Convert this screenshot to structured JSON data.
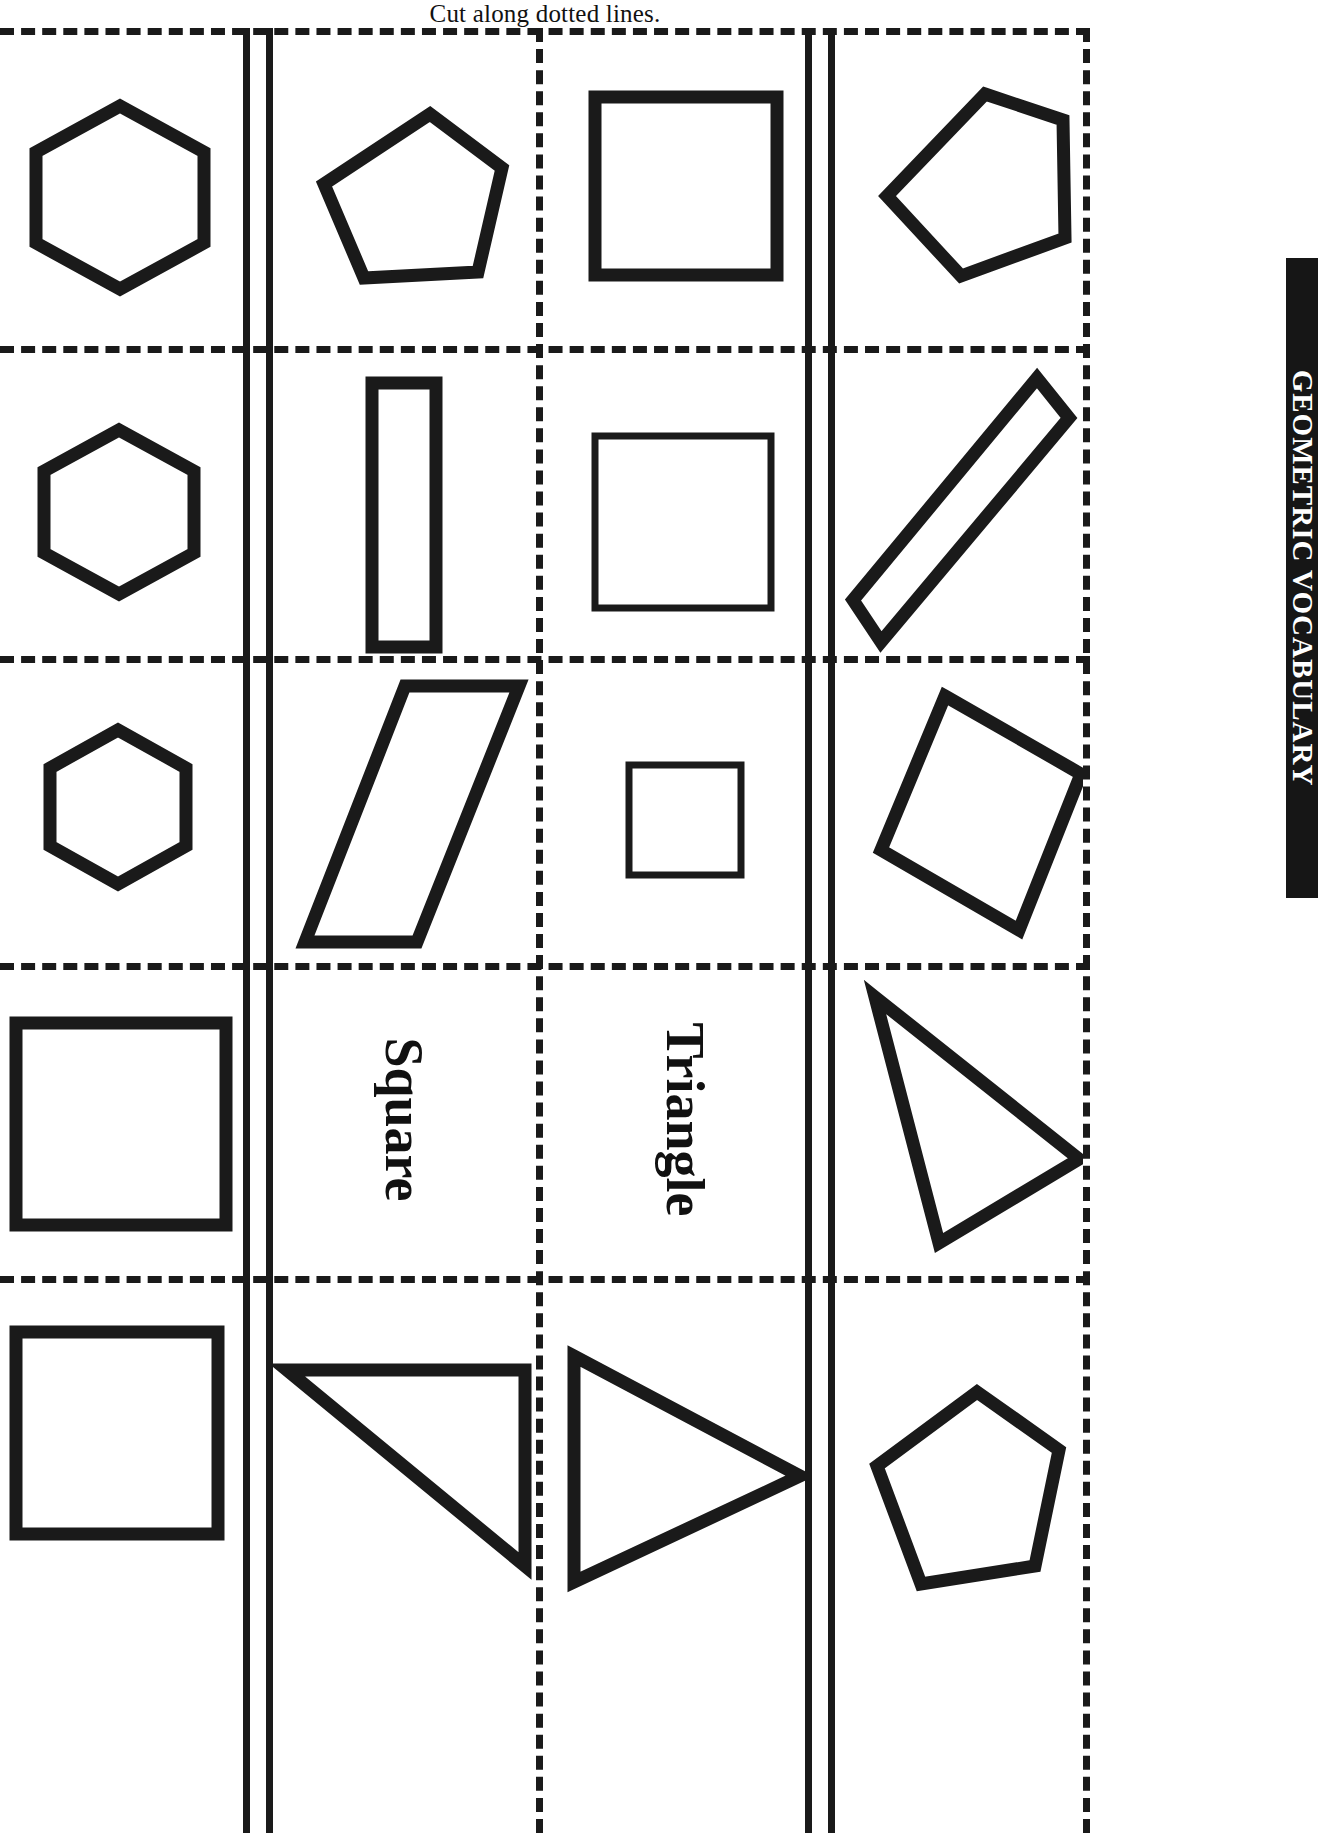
{
  "page": {
    "header_text": "Cut along dotted lines.",
    "side_tab_text": "GEOMETRIC VOCABULARY",
    "ink_color": "#1a1a1a",
    "background_color": "#ffffff",
    "tab_background_color": "#161616",
    "tab_text_color": "#ffffff",
    "columns": 4,
    "rows": 5
  },
  "cards": [
    {
      "id": "r1c1",
      "row": 1,
      "col": 1,
      "kind": "shape",
      "shape": "hexagon",
      "label": ""
    },
    {
      "id": "r1c2",
      "row": 1,
      "col": 2,
      "kind": "shape",
      "shape": "pentagon",
      "label": ""
    },
    {
      "id": "r1c3",
      "row": 1,
      "col": 3,
      "kind": "shape",
      "shape": "square",
      "label": ""
    },
    {
      "id": "r1c4",
      "row": 1,
      "col": 4,
      "kind": "shape",
      "shape": "pentagon",
      "label": ""
    },
    {
      "id": "r2c1",
      "row": 2,
      "col": 1,
      "kind": "shape",
      "shape": "hexagon",
      "label": ""
    },
    {
      "id": "r2c2",
      "row": 2,
      "col": 2,
      "kind": "shape",
      "shape": "rectangle",
      "label": ""
    },
    {
      "id": "r2c3",
      "row": 2,
      "col": 3,
      "kind": "shape",
      "shape": "square",
      "label": ""
    },
    {
      "id": "r2c4",
      "row": 2,
      "col": 4,
      "kind": "shape",
      "shape": "rectangle-rotated",
      "label": ""
    },
    {
      "id": "r3c1",
      "row": 3,
      "col": 1,
      "kind": "shape",
      "shape": "hexagon",
      "label": ""
    },
    {
      "id": "r3c2",
      "row": 3,
      "col": 2,
      "kind": "shape",
      "shape": "parallelogram",
      "label": ""
    },
    {
      "id": "r3c3",
      "row": 3,
      "col": 3,
      "kind": "shape",
      "shape": "square",
      "label": ""
    },
    {
      "id": "r3c4",
      "row": 3,
      "col": 4,
      "kind": "shape",
      "shape": "parallelogram-rotated",
      "label": ""
    },
    {
      "id": "r4c1",
      "row": 4,
      "col": 1,
      "kind": "shape",
      "shape": "square",
      "label": ""
    },
    {
      "id": "r4c2",
      "row": 4,
      "col": 2,
      "kind": "word",
      "shape": "",
      "label": "Square"
    },
    {
      "id": "r4c3",
      "row": 4,
      "col": 3,
      "kind": "word",
      "shape": "",
      "label": "Triangle"
    },
    {
      "id": "r4c4",
      "row": 4,
      "col": 4,
      "kind": "shape",
      "shape": "triangle-right",
      "label": ""
    },
    {
      "id": "r5c1",
      "row": 5,
      "col": 1,
      "kind": "shape",
      "shape": "square",
      "label": ""
    },
    {
      "id": "r5c2",
      "row": 5,
      "col": 2,
      "kind": "shape",
      "shape": "triangle-obtuse",
      "label": ""
    },
    {
      "id": "r5c3",
      "row": 5,
      "col": 3,
      "kind": "shape",
      "shape": "triangle-isosceles",
      "label": ""
    },
    {
      "id": "r5c4",
      "row": 5,
      "col": 4,
      "kind": "shape",
      "shape": "pentagon",
      "label": ""
    }
  ]
}
